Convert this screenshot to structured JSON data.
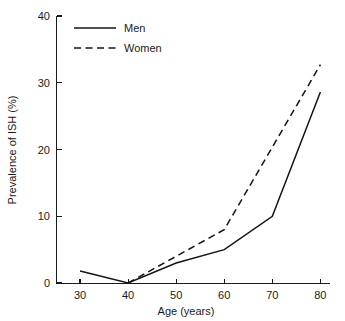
{
  "chart_data": {
    "type": "line",
    "title": "",
    "xlabel": "Age (years)",
    "ylabel": "Prevalence of ISH (%)",
    "xlim": [
      25,
      82
    ],
    "ylim": [
      0,
      40
    ],
    "xticks": [
      30,
      40,
      50,
      60,
      70,
      80
    ],
    "xtick_labels": [
      "30",
      "40",
      "50",
      "60",
      "70",
      "80"
    ],
    "yticks": [
      0,
      10,
      20,
      30,
      40
    ],
    "ytick_labels": [
      "0",
      "10",
      "20",
      "30",
      "40"
    ],
    "grid": false,
    "legend_position": "upper-left",
    "series": [
      {
        "name": "Men",
        "linestyle": "solid",
        "color": "#141414",
        "x": [
          30,
          40,
          50,
          60,
          70,
          80
        ],
        "values": [
          1.8,
          0.0,
          3.0,
          5.0,
          10.0,
          28.6
        ]
      },
      {
        "name": "Women",
        "linestyle": "dashed",
        "color": "#141414",
        "x": [
          40,
          50,
          60,
          80
        ],
        "values": [
          0.0,
          4.0,
          8.0,
          32.7
        ]
      }
    ],
    "legend_entries": [
      "Men",
      "Women"
    ]
  },
  "figure": {
    "background": "#ffffff",
    "foreground": "#1a1a1a"
  }
}
